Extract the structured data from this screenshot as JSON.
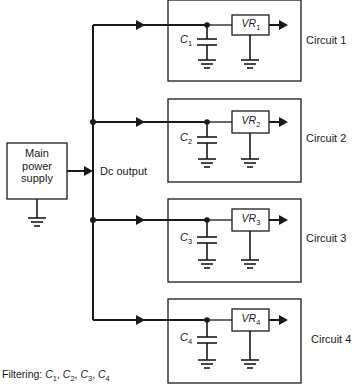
{
  "main_supply": {
    "label_lines": [
      "Main",
      "power",
      "supply"
    ]
  },
  "dc_output_label": "Dc output",
  "circuits": [
    {
      "label": "Circuit 1",
      "capacitor": "C",
      "capacitor_sub": "1",
      "regulator": "VR",
      "regulator_sub": "1"
    },
    {
      "label": "Circuit 2",
      "capacitor": "C",
      "capacitor_sub": "2",
      "regulator": "VR",
      "regulator_sub": "2"
    },
    {
      "label": "Circuit 3",
      "capacitor": "C",
      "capacitor_sub": "3",
      "regulator": "VR",
      "regulator_sub": "3"
    },
    {
      "label": "Circuit 4",
      "capacitor": "C",
      "capacitor_sub": "4",
      "regulator": "VR",
      "regulator_sub": "4"
    }
  ],
  "footer": {
    "prefix": "Filtering:",
    "items": [
      {
        "sym": "C",
        "sub": "1",
        "sep": ", "
      },
      {
        "sym": "C",
        "sub": "2",
        "sep": ", "
      },
      {
        "sym": "C",
        "sub": "3",
        "sep": ", "
      },
      {
        "sym": "C",
        "sub": "4",
        "sep": ""
      }
    ]
  },
  "colors": {
    "line": "#1a1a1a",
    "background": "#ffffff"
  }
}
